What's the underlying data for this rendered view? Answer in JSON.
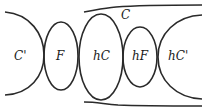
{
  "diagram": {
    "type": "region-decomposition",
    "stroke_color": "#2a2a2a",
    "background": "#ffffff",
    "labels": {
      "c_prime_left": "C'",
      "f": "F",
      "c_top": "C",
      "hc": "hC",
      "hf": "hF",
      "hc_prime": "hC'"
    },
    "shapes": {
      "left_arc": {
        "from": [
          5,
          12
        ],
        "apex": [
          44,
          55
        ],
        "to": [
          5,
          95
        ]
      },
      "f_ellipse": {
        "cx": 61,
        "cy": 56,
        "rx": 17,
        "ry": 34
      },
      "hc_ellipse": {
        "cx": 101,
        "cy": 57,
        "rx": 22,
        "ry": 43
      },
      "hf_ellipse": {
        "cx": 140,
        "cy": 57,
        "rx": 17,
        "ry": 30
      },
      "right_arc": {
        "from": [
          202,
          15
        ],
        "apex": [
          158,
          57
        ],
        "to": [
          202,
          99
        ]
      },
      "top_band_curve": {
        "from": [
          84,
          12
        ],
        "to": [
          202,
          5
        ]
      },
      "bottom_band_curve": {
        "from": [
          84,
          103
        ],
        "to": [
          202,
          106
        ]
      }
    }
  }
}
